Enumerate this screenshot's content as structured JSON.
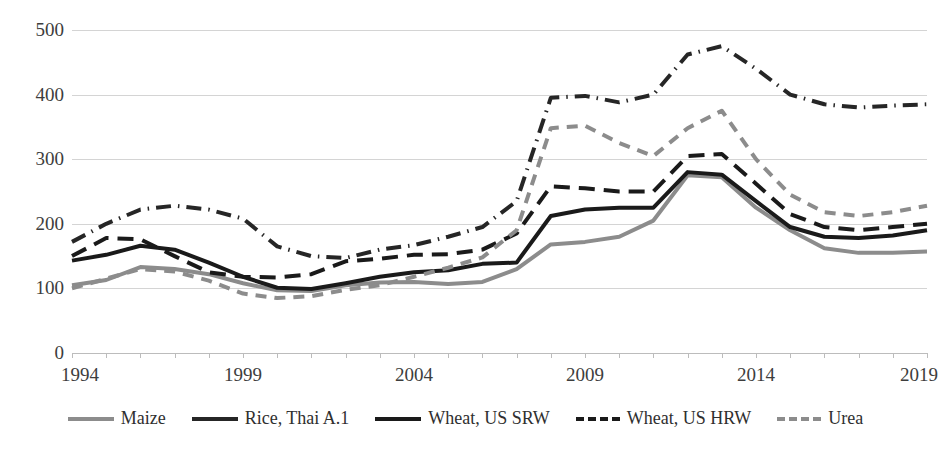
{
  "chart_data": {
    "type": "line",
    "title": "",
    "xlabel": "",
    "ylabel": "",
    "xlim": [
      1994,
      2019
    ],
    "ylim": [
      0,
      500
    ],
    "grid": true,
    "legend_position": "bottom",
    "y_ticks": [
      "0",
      "100",
      "200",
      "300",
      "400",
      "500"
    ],
    "x_ticks": [
      "1994",
      "1999",
      "2004",
      "2009",
      "2014",
      "2019"
    ],
    "x": [
      1994,
      1995,
      1996,
      1997,
      1998,
      1999,
      2000,
      2001,
      2002,
      2003,
      2004,
      2005,
      2006,
      2007,
      2008,
      2009,
      2010,
      2011,
      2012,
      2013,
      2014,
      2015,
      2016,
      2017,
      2018,
      2019
    ],
    "series": [
      {
        "name": "Maize",
        "color": "#8c8c8c",
        "dash": "solid",
        "width": 4,
        "values": [
          105,
          113,
          133,
          130,
          122,
          108,
          97,
          96,
          105,
          109,
          110,
          107,
          110,
          130,
          168,
          172,
          180,
          205,
          275,
          272,
          225,
          190,
          162,
          155,
          155,
          157
        ]
      },
      {
        "name": "Rice, Thai A.1",
        "color": "#262626",
        "dash": "dashdot",
        "width": 4,
        "values": [
          172,
          200,
          222,
          228,
          222,
          208,
          165,
          150,
          147,
          160,
          167,
          180,
          195,
          235,
          395,
          398,
          388,
          400,
          462,
          475,
          440,
          400,
          385,
          380,
          383,
          385
        ]
      },
      {
        "name": "Wheat, US SRW",
        "color": "#1a1a1a",
        "dash": "solid",
        "width": 4,
        "values": [
          143,
          152,
          166,
          160,
          140,
          118,
          101,
          99,
          108,
          118,
          125,
          128,
          138,
          140,
          212,
          222,
          225,
          225,
          280,
          276,
          235,
          195,
          180,
          178,
          182,
          190
        ]
      },
      {
        "name": "Wheat, US HRW",
        "color": "#1a1a1a",
        "dash": "dashed",
        "width": 4,
        "values": [
          150,
          178,
          176,
          150,
          125,
          118,
          117,
          122,
          142,
          146,
          152,
          153,
          160,
          185,
          258,
          255,
          250,
          250,
          305,
          308,
          262,
          215,
          195,
          190,
          195,
          200
        ]
      },
      {
        "name": "Urea",
        "color": "#8c8c8c",
        "dash": "shortdash",
        "width": 4,
        "values": [
          100,
          115,
          130,
          126,
          112,
          92,
          85,
          88,
          98,
          105,
          118,
          132,
          148,
          190,
          348,
          352,
          325,
          305,
          348,
          375,
          300,
          245,
          218,
          212,
          218,
          228
        ]
      }
    ]
  },
  "legend": {
    "items": [
      {
        "label": "Maize"
      },
      {
        "label": "Rice, Thai A.1"
      },
      {
        "label": "Wheat, US SRW"
      },
      {
        "label": "Wheat, US HRW"
      },
      {
        "label": "Urea"
      }
    ]
  }
}
